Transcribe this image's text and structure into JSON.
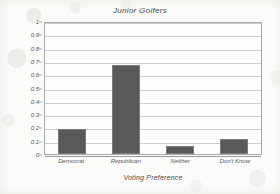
{
  "chart_data": {
    "type": "bar",
    "title": "Junior Golfers",
    "xlabel": "Voting Preference",
    "ylabel": "Proportion",
    "categories": [
      "Democrat",
      "Republican",
      "Neither",
      "Don't Know"
    ],
    "values": [
      0.19,
      0.67,
      0.06,
      0.11
    ],
    "ylim": [
      0,
      1
    ],
    "ytick_labels": [
      "1",
      "0.9",
      "0.8",
      "0.7",
      "0.6",
      "0.5",
      "0.4",
      "0.3",
      "0.2",
      "0.1",
      "0"
    ],
    "ytick_values": [
      1,
      0.9,
      0.8,
      0.7,
      0.6,
      0.5,
      0.4,
      0.3,
      0.2,
      0.1,
      0
    ],
    "grid": true,
    "legend": null,
    "bar_color": "#595959",
    "grid_color": "#cfcfcf",
    "frame_color": "#a8a8a8",
    "plot_background": "#fdfdfc",
    "page_background": "#fbfbf9"
  }
}
